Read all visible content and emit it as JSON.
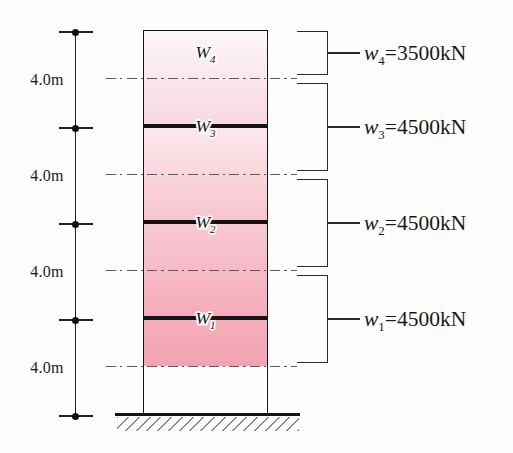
{
  "figure": {
    "type": "building-seismic-weight-diagram",
    "story_heights": [
      {
        "label": "4.0m"
      },
      {
        "label": "4.0m"
      },
      {
        "label": "4.0m"
      },
      {
        "label": "4.0m"
      }
    ],
    "stories": [
      {
        "floor": {
          "base": "W",
          "sub": "4"
        },
        "fill_top": "#fdf6f7",
        "fill_bottom": "#f7d8e0"
      },
      {
        "floor": {
          "base": "W",
          "sub": "3"
        },
        "fill_top": "#fbe9ed",
        "fill_bottom": "#f7c3ce"
      },
      {
        "floor": {
          "base": "W",
          "sub": "2"
        },
        "fill_top": "#f8c9d3",
        "fill_bottom": "#f5abb9"
      },
      {
        "floor": {
          "base": "W",
          "sub": "1"
        },
        "fill_top": "#f6aebb",
        "fill_bottom": "#f3a3b2"
      }
    ],
    "weights": [
      {
        "base": "w",
        "sub": "4",
        "value": "=3500kN"
      },
      {
        "base": "w",
        "sub": "3",
        "value": "=4500kN"
      },
      {
        "base": "w",
        "sub": "2",
        "value": "=4500kN"
      },
      {
        "base": "w",
        "sub": "1",
        "value": "=4500kN"
      }
    ],
    "line_colors": {
      "outline": "#161616",
      "slab": "#141414",
      "dashdot": "#5a5a5a",
      "bracket": "#2a2a2a",
      "ground": "#141414",
      "hatch": "#8a8a8a",
      "dimension": "#222222"
    }
  }
}
